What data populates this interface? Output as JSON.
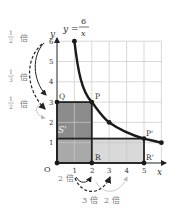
{
  "diagram": {
    "equation": {
      "lhs": "y =",
      "numerator": "6",
      "denominator": "x"
    },
    "axes": {
      "x_label": "x",
      "y_label": "y",
      "origin_label": "O",
      "x_ticks": [
        "1",
        "2",
        "3",
        "4",
        "5"
      ],
      "y_ticks": [
        "1",
        "2",
        "3",
        "4",
        "5",
        "6"
      ]
    },
    "points": {
      "P": "P",
      "Q": "Q",
      "R": "R",
      "P_prime": "P'",
      "R_prime": "R'"
    },
    "region_label": "S'",
    "y_arrows": [
      {
        "fraction_num": "1",
        "fraction_den": "2",
        "suffix": "倍"
      },
      {
        "fraction_num": "1",
        "fraction_den": "3",
        "suffix": "倍"
      },
      {
        "fraction_num": "1",
        "fraction_den": "2",
        "suffix": "倍"
      }
    ],
    "x_arrows": [
      {
        "label": "2 倍"
      },
      {
        "label": "3 倍"
      },
      {
        "label": "2 倍"
      }
    ],
    "colors": {
      "dark_region": "#8c8c8c",
      "mid_region": "#a9a9a9",
      "light_region": "#d9d9d9",
      "curve": "#1a1a1a",
      "grid": "#c8c8c8"
    }
  }
}
